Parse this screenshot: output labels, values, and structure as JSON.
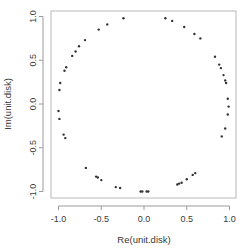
{
  "chart_data": {
    "type": "scatter",
    "title": "",
    "xlabel": "Re(unit.disk)",
    "ylabel": "Im(unit.disk)",
    "xlim": [
      -1.08,
      1.08
    ],
    "ylim": [
      -1.08,
      1.08
    ],
    "x_ticks": [
      -1.0,
      -0.5,
      0.0,
      0.5,
      1.0
    ],
    "x_tick_labels": [
      "-1.0",
      "-0.5",
      "0.0",
      "0.5",
      "1.0"
    ],
    "y_ticks": [
      -1.0,
      -0.5,
      0.0,
      0.5,
      1.0
    ],
    "y_tick_labels": [
      "-1.0",
      "-0.5",
      "0.0",
      "0.5",
      "1.0"
    ],
    "grid": false,
    "legend": null,
    "marker": "*",
    "marker_color": "#333333",
    "points": [
      {
        "x": -0.24,
        "y": 0.98
      },
      {
        "x": -0.43,
        "y": 0.91
      },
      {
        "x": -0.53,
        "y": 0.85
      },
      {
        "x": -0.69,
        "y": 0.73
      },
      {
        "x": -0.76,
        "y": 0.66
      },
      {
        "x": -0.8,
        "y": 0.6
      },
      {
        "x": -0.84,
        "y": 0.55
      },
      {
        "x": -0.91,
        "y": 0.42
      },
      {
        "x": -0.93,
        "y": 0.38
      },
      {
        "x": -0.98,
        "y": 0.24
      },
      {
        "x": -0.99,
        "y": 0.16
      },
      {
        "x": 0.25,
        "y": 0.98
      },
      {
        "x": 0.33,
        "y": 0.95
      },
      {
        "x": 0.47,
        "y": 0.88
      },
      {
        "x": 0.59,
        "y": 0.8
      },
      {
        "x": 0.66,
        "y": 0.75
      },
      {
        "x": 0.83,
        "y": 0.54
      },
      {
        "x": 0.88,
        "y": 0.45
      },
      {
        "x": 0.9,
        "y": 0.41
      },
      {
        "x": 0.93,
        "y": 0.33
      },
      {
        "x": 0.95,
        "y": 0.27
      },
      {
        "x": 0.96,
        "y": 0.24
      },
      {
        "x": 0.98,
        "y": 0.06
      },
      {
        "x": -1.0,
        "y": -0.08
      },
      {
        "x": -0.99,
        "y": -0.17
      },
      {
        "x": -0.94,
        "y": -0.35
      },
      {
        "x": -0.92,
        "y": -0.39
      },
      {
        "x": -0.68,
        "y": -0.73
      },
      {
        "x": -0.56,
        "y": -0.83
      },
      {
        "x": -0.54,
        "y": -0.84
      },
      {
        "x": -0.5,
        "y": -0.87
      },
      {
        "x": -0.33,
        "y": -0.95
      },
      {
        "x": -0.28,
        "y": -0.96
      },
      {
        "x": -0.04,
        "y": -1.0
      },
      {
        "x": -0.02,
        "y": -1.0
      },
      {
        "x": 0.03,
        "y": -1.0
      },
      {
        "x": 0.05,
        "y": -1.0
      },
      {
        "x": 0.99,
        "y": -0.03
      },
      {
        "x": 0.98,
        "y": -0.12
      },
      {
        "x": 0.95,
        "y": -0.28
      },
      {
        "x": 0.91,
        "y": -0.37
      },
      {
        "x": 0.39,
        "y": -0.92
      },
      {
        "x": 0.41,
        "y": -0.91
      },
      {
        "x": 0.44,
        "y": -0.9
      },
      {
        "x": 0.5,
        "y": -0.86
      },
      {
        "x": 0.57,
        "y": -0.81
      },
      {
        "x": 0.6,
        "y": -0.79
      }
    ]
  }
}
